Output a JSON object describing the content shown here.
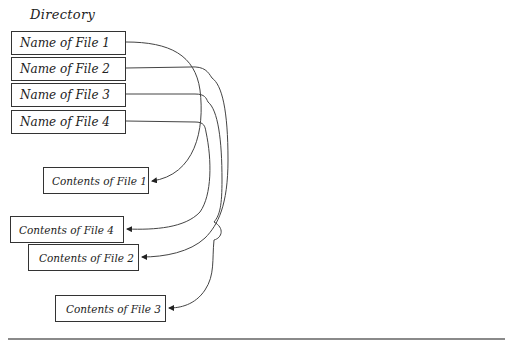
{
  "diagram": {
    "title": "Directory",
    "directory_entries": [
      {
        "label": "Name of File 1",
        "points_to": "Contents of File 1"
      },
      {
        "label": "Name of File 2",
        "points_to": "Contents of File 2"
      },
      {
        "label": "Name of File 3",
        "points_to": "Contents of File 3"
      },
      {
        "label": "Name of File 4",
        "points_to": "Contents of File 4"
      }
    ],
    "content_blocks": [
      {
        "label": "Contents of File 1"
      },
      {
        "label": "Contents of File 4"
      },
      {
        "label": "Contents of File 2"
      },
      {
        "label": "Contents of File 3"
      }
    ],
    "line_color": "#333333"
  }
}
